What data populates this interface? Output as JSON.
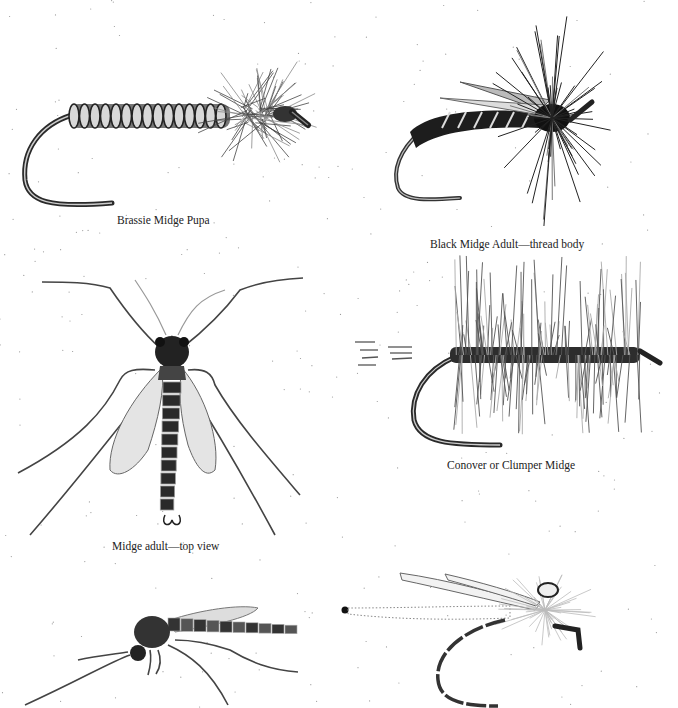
{
  "page": {
    "type": "illustration-plate"
  },
  "figures": [
    {
      "id": "brassie-midge-pupa",
      "caption": "Brassie Midge Pupa",
      "kind": "fly-pattern"
    },
    {
      "id": "black-midge-adult",
      "caption": "Black Midge Adult—thread body",
      "kind": "fly-pattern"
    },
    {
      "id": "midge-adult-top",
      "caption": "Midge adult—top view",
      "kind": "natural-insect"
    },
    {
      "id": "conover-midge",
      "caption": "Conover or Clumper Midge",
      "kind": "fly-pattern"
    },
    {
      "id": "midge-adult-side",
      "caption": "",
      "kind": "natural-insect"
    },
    {
      "id": "emerger-pattern",
      "caption": "",
      "kind": "fly-pattern"
    }
  ],
  "colors": {
    "ink": "#1a1a1a",
    "hook": "#2a2a2a",
    "hackle": "#4a4a4a",
    "wing": "#8a8a8a",
    "paper": "#ffffff"
  }
}
